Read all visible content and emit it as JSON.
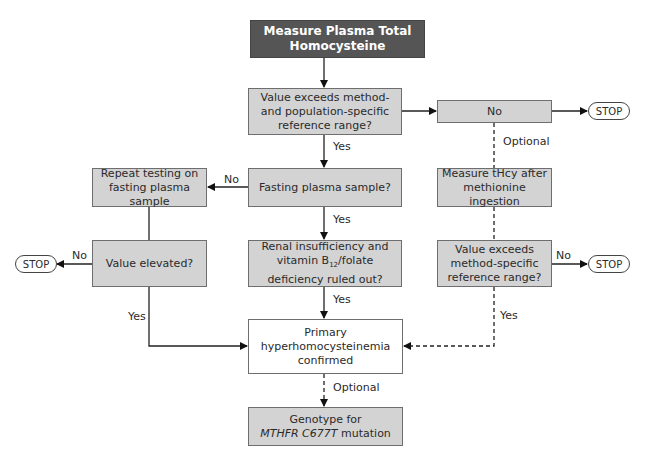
{
  "nodes": {
    "start": "Measure Plasma Total Homocysteine",
    "q_exceeds": "Value exceeds method- and population-specific reference range?",
    "no_box": "No",
    "q_fasting": "Fasting plasma sample?",
    "repeat": "Repeat testing on fasting plasma sample",
    "q_elevated": "Value elevated?",
    "q_renal_pre": "Renal insufficiency and vitamin B",
    "q_renal_sub": "12",
    "q_renal_post": "/folate deficiency ruled out?",
    "measure_methionine": "Measure tHcy after methionine ingestion",
    "q_method_specific": "Value exceeds method-specific reference range?",
    "confirmed": "Primary hyperhomocysteinemia confirmed",
    "genotype_pre": "Genotype for",
    "genotype_italic": "MTHFR C677T",
    "genotype_post": "mutation"
  },
  "stops": {
    "stop1": "STOP",
    "stop2": "STOP",
    "stop3": "STOP"
  },
  "edge_labels": {
    "yes1": "Yes",
    "yes2": "Yes",
    "yes3": "Yes",
    "yes_left": "Yes",
    "yes_right": "Yes",
    "no_fasting": "No",
    "no_elevated": "No",
    "no_method": "No",
    "optional1": "Optional",
    "optional2": "Optional"
  }
}
